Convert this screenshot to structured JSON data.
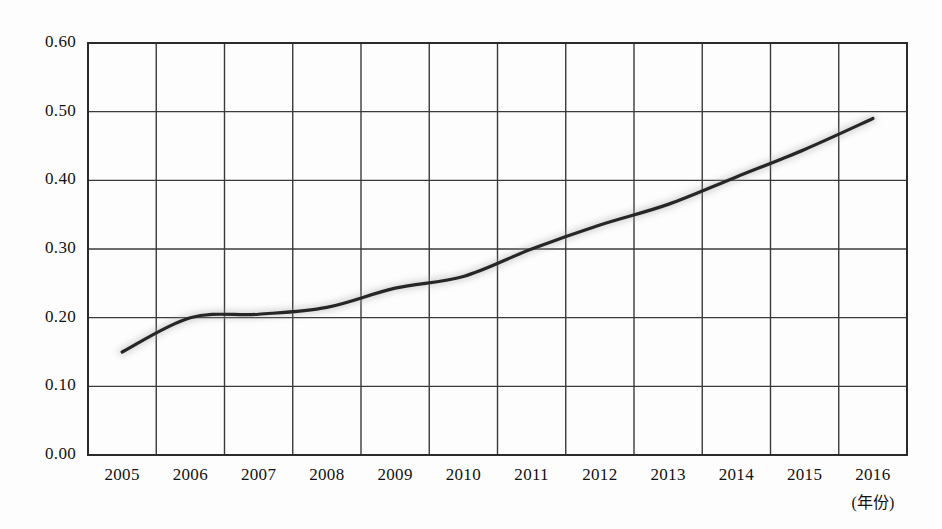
{
  "chart_data": {
    "type": "line",
    "title": "",
    "subtitle": "",
    "xlabel": "(年份)",
    "ylabel": "",
    "categories": [
      "2005",
      "2006",
      "2007",
      "2008",
      "2009",
      "2010",
      "2011",
      "2012",
      "2013",
      "2014",
      "2015",
      "2016"
    ],
    "x": [
      2005,
      2006,
      2007,
      2008,
      2009,
      2010,
      2011,
      2012,
      2013,
      2014,
      2015,
      2016
    ],
    "values": [
      0.15,
      0.2,
      0.205,
      0.215,
      0.243,
      0.26,
      0.3,
      0.335,
      0.365,
      0.405,
      0.445,
      0.49
    ],
    "series": [
      {
        "name": "",
        "values": [
          0.15,
          0.2,
          0.205,
          0.215,
          0.243,
          0.26,
          0.3,
          0.335,
          0.365,
          0.405,
          0.445,
          0.49
        ],
        "color": "#262626"
      }
    ],
    "ylim": [
      0.0,
      0.6
    ],
    "ytick_values": [
      0.0,
      0.1,
      0.2,
      0.3,
      0.4,
      0.5,
      0.6
    ],
    "ytick_labels": [
      "0.00",
      "0.10",
      "0.20",
      "0.30",
      "0.40",
      "0.50",
      "0.60"
    ],
    "xtick_labels": [
      "2005",
      "2006",
      "2007",
      "2008",
      "2009",
      "2010",
      "2011",
      "2012",
      "2013",
      "2014",
      "2015",
      "2016"
    ],
    "grid": true,
    "grid_color": "#3a3a3a",
    "legend": false,
    "legend_position": "none",
    "annotations": []
  },
  "axes": {
    "x_unit_label": "(年份)",
    "frame_color": "#2b2b2b",
    "background": "#ffffff"
  }
}
